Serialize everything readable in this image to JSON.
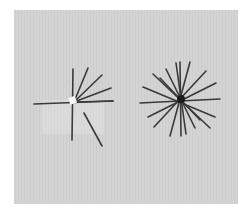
{
  "scene": {
    "description": "Photograph of two arrangements of dark sticks/pins on a light gray textured board",
    "colors": {
      "page": "#ffffff",
      "board": "#d3d3d3",
      "stick": "#3a3a3a",
      "highlight": "#f2f2f2"
    },
    "board": {
      "x": 14,
      "y": 10,
      "width": 224,
      "height": 194
    },
    "left_figure": {
      "label": "partial-fan",
      "center": [
        74,
        102
      ],
      "patch": {
        "x": 42,
        "y": 100,
        "width": 62,
        "height": 34
      },
      "sticks": [
        [
          73,
          69,
          72,
          140
        ],
        [
          34,
          104,
          113,
          101
        ],
        [
          74,
          102,
          88,
          68
        ],
        [
          74,
          102,
          102,
          75
        ],
        [
          74,
          102,
          111,
          88
        ],
        [
          74,
          102,
          113,
          101
        ],
        [
          84,
          113,
          102,
          146
        ]
      ]
    },
    "right_figure": {
      "label": "starburst",
      "center": [
        181,
        99
      ],
      "hub_radius": 4,
      "sticks": [
        [
          180,
          62,
          181,
          136
        ],
        [
          190,
          62,
          170,
          136
        ],
        [
          166,
          69,
          195,
          128
        ],
        [
          153,
          74,
          210,
          128
        ],
        [
          143,
          87,
          215,
          117
        ],
        [
          140,
          103,
          220,
          99
        ],
        [
          148,
          117,
          216,
          83
        ],
        [
          154,
          127,
          206,
          71
        ],
        [
          176,
          63,
          186,
          134
        ],
        [
          160,
          78,
          200,
          120
        ]
      ]
    }
  }
}
